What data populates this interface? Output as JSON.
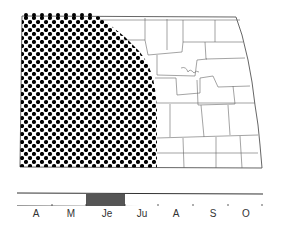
{
  "map": {
    "region": "North Dakota",
    "shaded_area_description": "Western portion of state (dot pattern)",
    "colors": {
      "outline": "#555555",
      "dots": "#000000",
      "background": "#ffffff"
    }
  },
  "timeline": {
    "months": [
      "A",
      "M",
      "Je",
      "Ju",
      "A",
      "S",
      "O"
    ],
    "active_period": {
      "start": "late May",
      "end": "late June"
    },
    "colors": {
      "bar": "#555555",
      "line": "#333333"
    }
  }
}
